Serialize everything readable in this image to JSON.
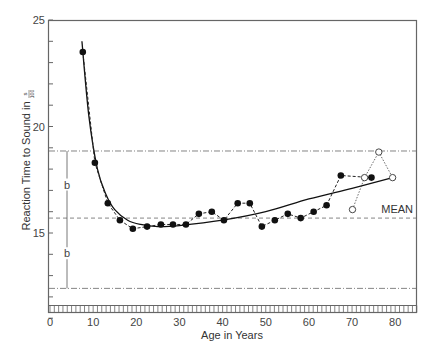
{
  "chart_data": {
    "type": "line",
    "title": "",
    "xlabel": "Age in Years",
    "ylabel": "Reaction Time to Sound in s/100",
    "ylabel_main": "Reaction Time to Sound in",
    "ylabel_frac_num": "s",
    "ylabel_frac_den": "100",
    "xlim": [
      0,
      85
    ],
    "ylim": [
      11,
      25
    ],
    "x_ticks": [
      0,
      10,
      20,
      30,
      40,
      50,
      60,
      70,
      80
    ],
    "y_ticks": [
      15,
      20,
      25
    ],
    "grid": false,
    "series": [
      {
        "name": "Observed (filled)",
        "style": "dashed line, filled circles",
        "x": [
          7.6,
          10.4,
          13.4,
          16.2,
          19.2,
          22.5,
          25.7,
          28.5,
          31.5,
          34.5,
          37.5,
          40.3,
          43.5,
          46.3,
          49.1,
          52.1,
          55.1,
          58.1,
          61.1,
          64.1,
          67.4,
          74.5
        ],
        "y": [
          23.5,
          18.3,
          16.4,
          15.6,
          15.2,
          15.3,
          15.4,
          15.4,
          15.4,
          15.9,
          16.0,
          15.6,
          16.4,
          16.4,
          15.3,
          15.6,
          15.9,
          15.7,
          16.0,
          16.3,
          17.7,
          17.6
        ]
      },
      {
        "name": "Observed (open)",
        "style": "dotted line, open circles",
        "x": [
          70.1,
          72.9,
          76.2,
          79.4
        ],
        "y": [
          16.1,
          17.6,
          18.8,
          17.6
        ]
      },
      {
        "name": "Fitted curve",
        "style": "solid line",
        "x": [
          7.4,
          9,
          11,
          13,
          15,
          18,
          21,
          25,
          30,
          40,
          50,
          60,
          70,
          79.4
        ],
        "y": [
          24.0,
          20.5,
          18.0,
          16.8,
          16.1,
          15.6,
          15.4,
          15.3,
          15.35,
          15.6,
          16.0,
          16.6,
          17.1,
          17.6
        ]
      }
    ],
    "reference_lines": [
      {
        "label": "",
        "y": 18.85,
        "style": "dash-dot"
      },
      {
        "label": "MEAN",
        "y": 15.7,
        "style": "dashed"
      },
      {
        "label": "",
        "y": 12.4,
        "style": "dash-dot"
      }
    ],
    "annotations": [
      {
        "text": "b",
        "x": 3.9,
        "y": 17.3
      },
      {
        "text": "b",
        "x": 3.9,
        "y": 14.0
      },
      {
        "text": "MEAN",
        "x": 82,
        "y": 16.2
      }
    ]
  }
}
